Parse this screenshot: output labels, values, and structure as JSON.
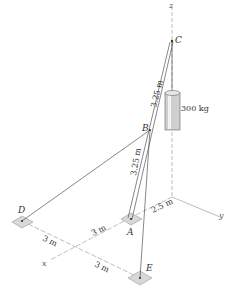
{
  "diagram": {
    "type": "3d-statics-mast-cable",
    "points": {
      "A": "A",
      "B": "B",
      "C": "C",
      "D": "D",
      "E": "E"
    },
    "axes": {
      "x": "x",
      "y": "y",
      "z": "z"
    },
    "mass_label": "300 kg",
    "dimensions": {
      "CB": "3.25 m",
      "BA": "3.25 m",
      "origin_to_A": "2.5 m",
      "D_to_x_axis": "3 m",
      "A_to_x_axis": "3 m",
      "x_axis_to_E": "3 m"
    },
    "colors": {
      "line": "#555555",
      "axis": "#9a9a9a",
      "pad_fill": "#d8d8d8",
      "cylinder": "#cfcfcf"
    }
  }
}
